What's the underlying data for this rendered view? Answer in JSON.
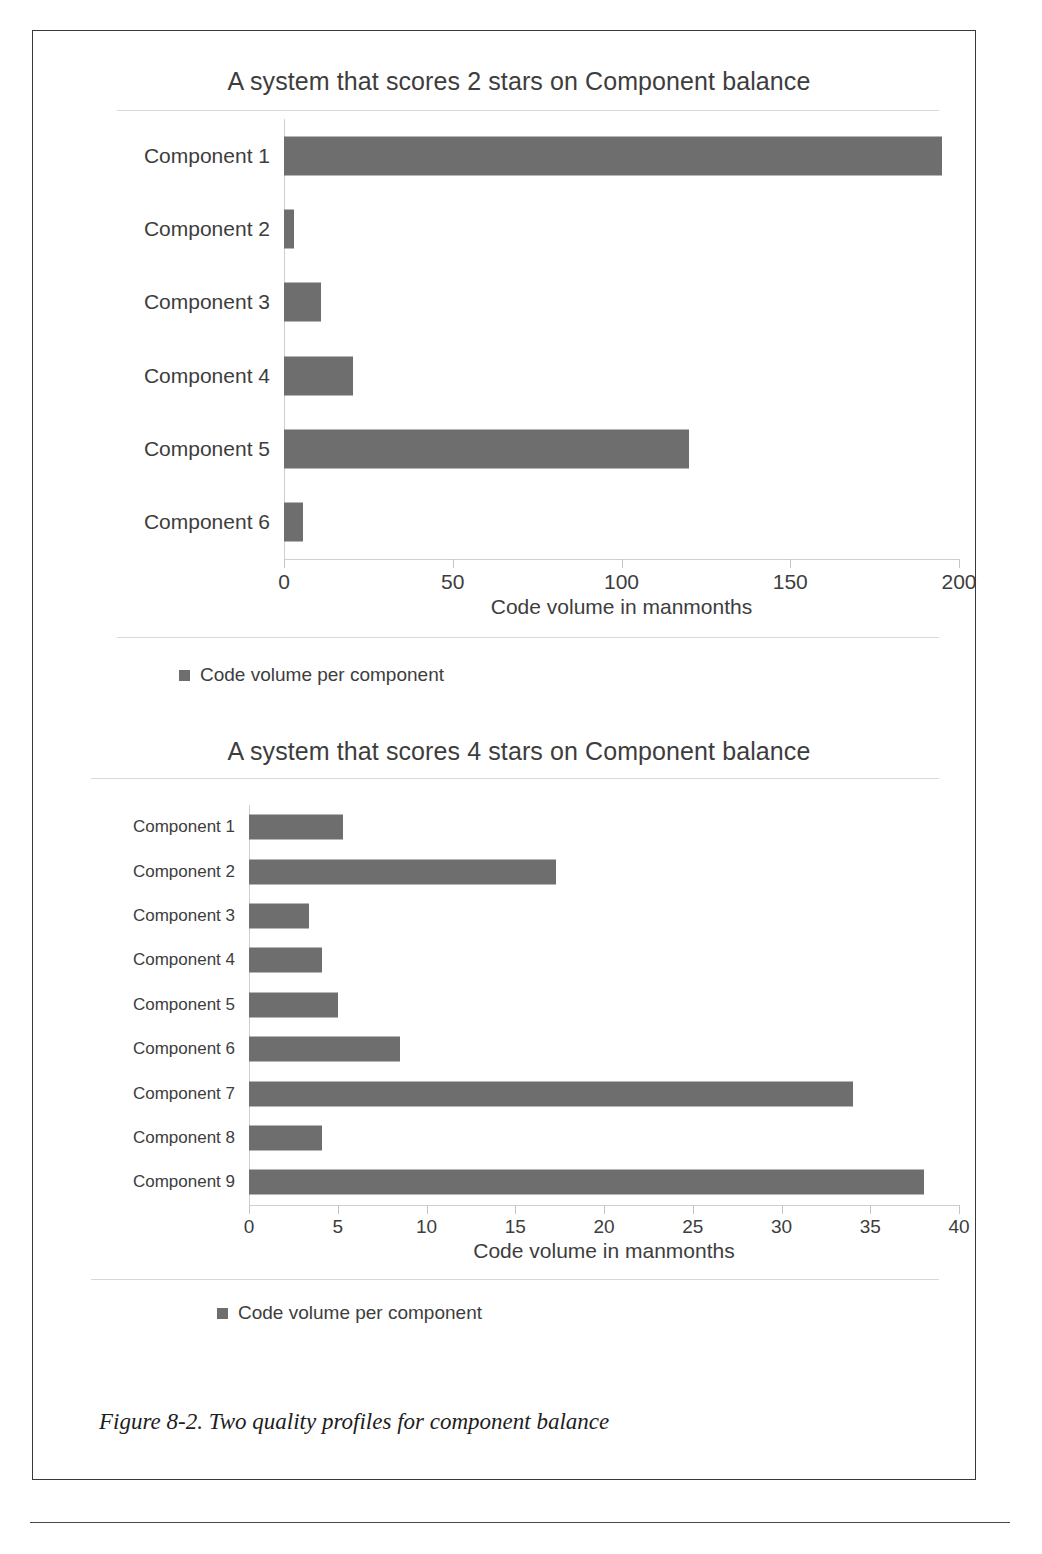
{
  "figure": {
    "caption": "Figure 8-2. Two quality profiles for component balance"
  },
  "chart_data": [
    {
      "type": "bar",
      "orientation": "horizontal",
      "title": "A system that scores 2 stars on Component balance",
      "xlabel": "Code volume in manmonths",
      "ylabel": "",
      "categories": [
        "Component 1",
        "Component 2",
        "Component 3",
        "Component 4",
        "Component 5",
        "Component 6"
      ],
      "values": [
        195,
        3,
        11,
        20.5,
        120,
        5.5
      ],
      "xlim": [
        0,
        200
      ],
      "xticks": [
        0,
        50,
        100,
        150,
        200
      ],
      "xtick_labels": [
        "0",
        "50",
        "100",
        "150",
        "200"
      ],
      "grid": false,
      "legend": [
        "Code volume per component"
      ],
      "legend_position": "bottom-left",
      "bar_color": "#6e6e6e"
    },
    {
      "type": "bar",
      "orientation": "horizontal",
      "title": "A system that scores 4 stars on Component balance",
      "xlabel": "Code volume in manmonths",
      "ylabel": "",
      "categories": [
        "Component 1",
        "Component 2",
        "Component 3",
        "Component 4",
        "Component 5",
        "Component 6",
        "Component 7",
        "Component 8",
        "Component 9"
      ],
      "values": [
        5.3,
        17.3,
        3.4,
        4.1,
        5.0,
        8.5,
        34,
        4.1,
        38
      ],
      "xlim": [
        0,
        40
      ],
      "xticks": [
        0,
        5,
        10,
        15,
        20,
        25,
        30,
        35,
        40
      ],
      "xtick_labels": [
        "0",
        "5",
        "10",
        "15",
        "20",
        "25",
        "30",
        "35",
        "40"
      ],
      "grid": false,
      "legend": [
        "Code volume per component"
      ],
      "legend_position": "bottom-left",
      "bar_color": "#6e6e6e"
    }
  ]
}
